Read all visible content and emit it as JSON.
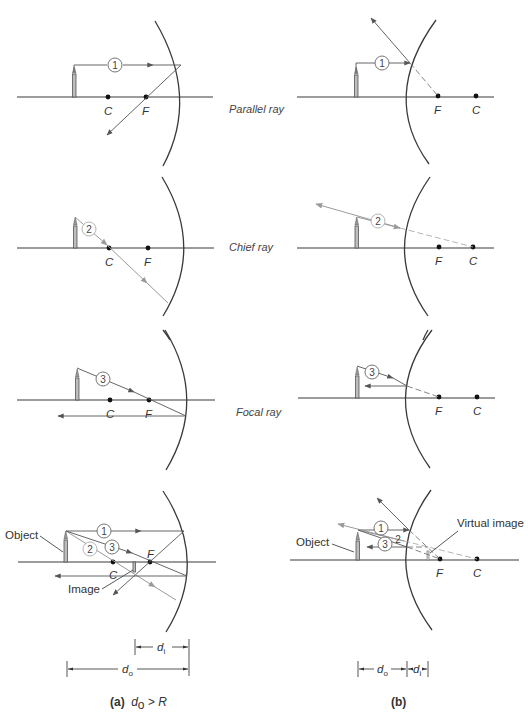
{
  "figure": {
    "row_labels": {
      "parallel": "Parallel ray",
      "chief": "Chief ray",
      "focal": "Focal ray"
    },
    "points": {
      "center": "C",
      "focus": "F"
    },
    "ray_numbers": {
      "one": "1",
      "two": "2",
      "three": "3"
    },
    "annotations": {
      "object_a": "Object",
      "image_a": "Image",
      "object_b": "Object",
      "virtual_image_b": "Virtual image"
    },
    "dimensions": {
      "d": "d",
      "sub_o": "o",
      "sub_i": "i"
    },
    "captions": {
      "a_label": "(a)",
      "a_condition_var": "d",
      "a_condition_sub": "o",
      "a_condition_rest": " > R",
      "b_label": "(b)"
    },
    "colors": {
      "line": "#3a3a3a",
      "ray_dark": "#555555",
      "ray_light": "#9a9a9a",
      "point": "#111111",
      "background": "#ffffff"
    }
  }
}
